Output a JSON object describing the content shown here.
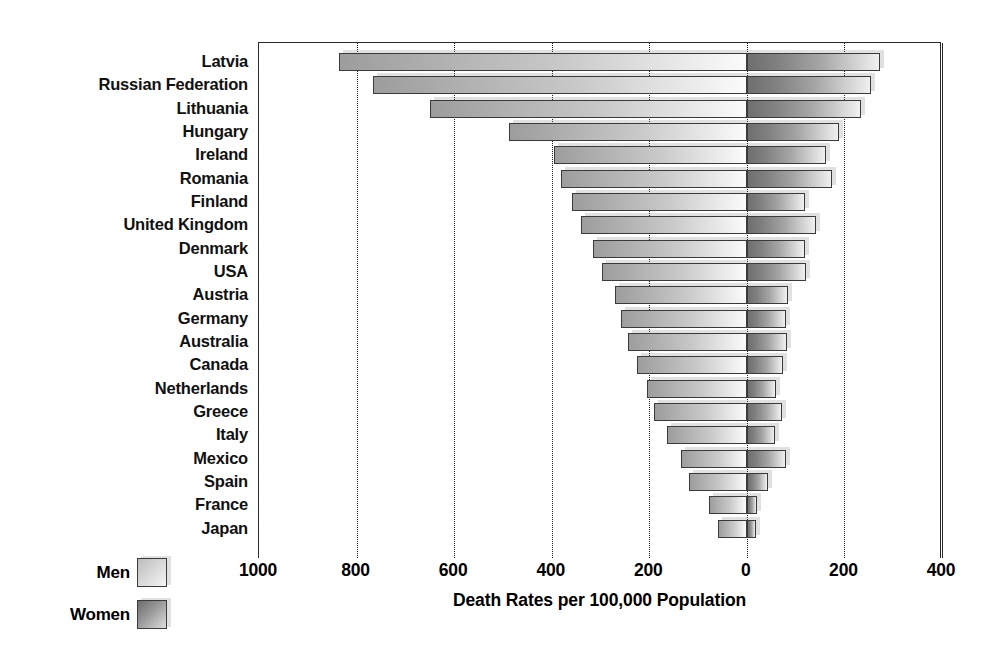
{
  "chart_data": {
    "type": "bar",
    "orientation": "horizontal",
    "style": "bidirectional-population-pyramid",
    "title": "",
    "xlabel": "Death Rates per 100,000 Population",
    "ylabel": "",
    "xlim": [
      -1000,
      400
    ],
    "xticks": [
      1000,
      800,
      600,
      400,
      200,
      0,
      200,
      400
    ],
    "grid": "vertical-dotted",
    "legend_position": "bottom-left",
    "categories": [
      "Latvia",
      "Russian Federation",
      "Lithuania",
      "Hungary",
      "Ireland",
      "Romania",
      "Finland",
      "United Kingdom",
      "Denmark",
      "USA",
      "Austria",
      "Germany",
      "Australia",
      "Canada",
      "Netherlands",
      "Greece",
      "Italy",
      "Mexico",
      "Spain",
      "France",
      "Japan"
    ],
    "series": [
      {
        "name": "Men",
        "direction": "left",
        "values": [
          835,
          767,
          649,
          487,
          395,
          381,
          359,
          340,
          315,
          297,
          270,
          258,
          243,
          225,
          204,
          190,
          163,
          136,
          118,
          78,
          60
        ]
      },
      {
        "name": "Women",
        "direction": "right",
        "values": [
          272,
          254,
          233,
          188,
          163,
          175,
          120,
          142,
          120,
          122,
          84,
          80,
          82,
          74,
          60,
          72,
          58,
          80,
          43,
          21,
          18
        ]
      }
    ]
  },
  "legend": {
    "men_label": "Men",
    "women_label": "Women"
  },
  "axis": {
    "title": "Death Rates per 100,000 Population",
    "ticks": [
      "1000",
      "800",
      "600",
      "400",
      "200",
      "0",
      "200",
      "400"
    ]
  }
}
